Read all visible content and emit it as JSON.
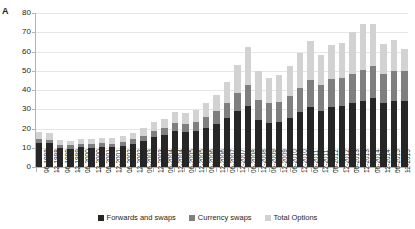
{
  "panel": {
    "letter": "A"
  },
  "legend": {
    "items": [
      {
        "label": "Forwards and swaps",
        "color": "#262626",
        "swatch": "legend-swatch-forwards"
      },
      {
        "label": "Currency swaps",
        "color": "#7f7f7f",
        "swatch": "legend-swatch-currency"
      },
      {
        "label": "Total Options",
        "color": "#d2d2d2",
        "swatch": "legend-swatch-options"
      }
    ]
  },
  "axes": {
    "y_ticks": [
      "0",
      "10",
      "20",
      "30",
      "40",
      "50",
      "60",
      "70",
      "80"
    ],
    "y_min": 0,
    "y_max": 80,
    "y_step": 10
  },
  "chart_data": {
    "type": "bar",
    "stacked": true,
    "title": "",
    "xlabel": "",
    "ylabel": "",
    "ylim": [
      0,
      80
    ],
    "grid": true,
    "legend_position": "bottom",
    "categories": [
      "06-1998",
      "12-1998",
      "06-1999",
      "12-1999",
      "06-2000",
      "12-2000",
      "06-2001",
      "12-2001",
      "06-2002",
      "12-2002",
      "06-2003",
      "12-2003",
      "06-2004",
      "12-2004",
      "06-2005",
      "12-2005",
      "06-2006",
      "12-2006",
      "06-2007",
      "12-2007",
      "06-2008",
      "12-2008",
      "06-2009",
      "12-2009",
      "06-2010",
      "12-2010",
      "06-2011",
      "12-2011",
      "06-2012",
      "12-2012",
      "06-2013",
      "12-2013",
      "06-2014",
      "12-2014",
      "06-2015",
      "12-2015"
    ],
    "series": [
      {
        "name": "Forwards and swaps",
        "color": "#262626",
        "values": [
          12.5,
          12.3,
          10.0,
          9.6,
          10.3,
          10.1,
          10.6,
          10.3,
          11.0,
          12.0,
          13.5,
          15.5,
          16.5,
          18.5,
          18.0,
          18.5,
          20.5,
          22.5,
          25.5,
          29.0,
          31.5,
          24.5,
          23.0,
          23.5,
          25.5,
          28.5,
          31.0,
          29.0,
          31.0,
          31.5,
          33.0,
          34.5,
          36.0,
          33.0,
          34.5,
          34.5
        ]
      },
      {
        "name": "Currency swaps",
        "color": "#7f7f7f",
        "values": [
          2.0,
          1.8,
          1.6,
          1.6,
          1.7,
          1.7,
          1.8,
          1.9,
          2.1,
          2.4,
          2.8,
          3.2,
          3.6,
          4.2,
          4.5,
          5.0,
          5.5,
          6.5,
          8.0,
          9.5,
          11.0,
          10.5,
          10.0,
          10.5,
          11.5,
          12.5,
          14.0,
          13.5,
          14.5,
          15.0,
          15.5,
          16.0,
          16.5,
          15.5,
          15.5,
          15.5
        ]
      },
      {
        "name": "Total Options",
        "color": "#d2d2d2",
        "values": [
          3.5,
          3.4,
          2.6,
          2.4,
          2.6,
          2.7,
          2.9,
          2.8,
          3.0,
          3.4,
          3.8,
          4.6,
          5.0,
          6.0,
          5.7,
          6.2,
          7.5,
          8.5,
          10.5,
          14.5,
          20.0,
          15.0,
          13.5,
          14.0,
          15.5,
          18.0,
          20.5,
          15.5,
          18.0,
          18.0,
          21.5,
          24.0,
          22.0,
          15.5,
          16.0,
          11.5
        ]
      }
    ]
  }
}
